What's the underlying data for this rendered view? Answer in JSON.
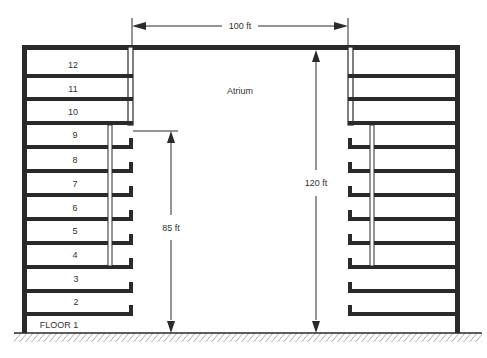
{
  "diagram": {
    "colors": {
      "ink": "#2a2a2a",
      "paper": "#ffffff",
      "text": "#333333"
    },
    "labels": {
      "atrium": "Atrium",
      "width_dim": "100 ft",
      "height_dim": "120 ft",
      "lower_dim": "85 ft"
    },
    "floors": [
      {
        "label": "12"
      },
      {
        "label": "11"
      },
      {
        "label": "10"
      },
      {
        "label": "9"
      },
      {
        "label": "8"
      },
      {
        "label": "7"
      },
      {
        "label": "6"
      },
      {
        "label": "5"
      },
      {
        "label": "4"
      },
      {
        "label": "3"
      },
      {
        "label": "2"
      },
      {
        "label": "FLOOR 1"
      }
    ]
  }
}
